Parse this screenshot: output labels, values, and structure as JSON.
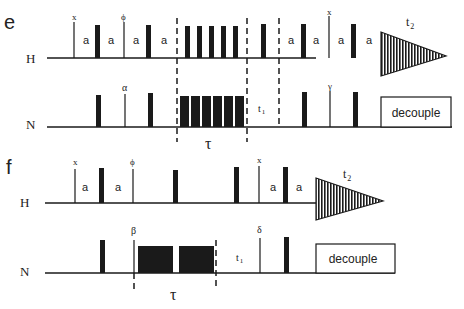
{
  "panels": {
    "e": {
      "label": "e",
      "channels": {
        "H": "H",
        "N": "N"
      },
      "delay_label": "a",
      "phases": {
        "h1": "x",
        "h2": "ϕ",
        "h3": "x",
        "n1": "α",
        "n2": "γ"
      },
      "tau": "τ",
      "t1": "t",
      "t1_sub": "1",
      "t2": "t",
      "t2_sub": "2",
      "decouple": "decouple",
      "h_train_pulses": 5,
      "n_train_pulses": 6
    },
    "f": {
      "label": "f",
      "channels": {
        "H": "H",
        "N": "N"
      },
      "delay_label": "a",
      "phases": {
        "h1": "x",
        "h2": "ϕ",
        "h3": "x",
        "n1": "β",
        "n2": "δ"
      },
      "tau": "τ",
      "t1": "t",
      "t1_sub": "1",
      "t2": "t",
      "t2_sub": "2",
      "decouple": "decouple",
      "n_blocks": 2
    }
  },
  "colors": {
    "ink": "#1a1a1a",
    "background": "#ffffff"
  }
}
